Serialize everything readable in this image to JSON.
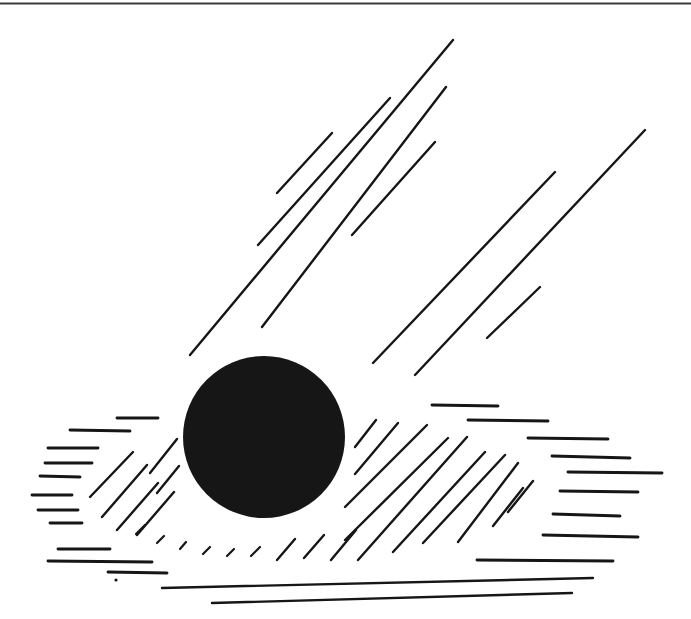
{
  "figure": {
    "background": "#ffffff",
    "ink": "#161616",
    "rule_color": "#3a3a3a",
    "canvas": {
      "width": 691,
      "height": 619
    },
    "top_rule": {
      "x1": 0,
      "y1": 3.5,
      "x2": 691,
      "y2": 3.5
    },
    "circle": {
      "cx": 264,
      "cy": 437,
      "r": 81
    },
    "rays": [
      [
        277,
        193,
        332,
        133
      ],
      [
        258,
        245,
        390,
        98
      ],
      [
        262,
        327,
        446,
        87
      ],
      [
        190,
        355,
        453,
        40
      ],
      [
        352,
        235,
        435,
        142
      ],
      [
        373,
        363,
        555,
        172
      ],
      [
        415,
        375,
        645,
        130
      ],
      [
        487,
        338,
        540,
        287
      ]
    ],
    "left_hatch": [
      [
        90,
        497,
        133,
        452
      ],
      [
        102,
        517,
        147,
        465
      ],
      [
        117,
        530,
        158,
        483
      ],
      [
        137,
        535,
        174,
        492
      ],
      [
        150,
        473,
        177,
        439
      ],
      [
        157,
        493,
        179,
        466
      ]
    ],
    "right_hatch": [
      [
        355,
        447,
        376,
        420
      ],
      [
        355,
        474,
        398,
        423
      ],
      [
        345,
        507,
        427,
        425
      ],
      [
        345,
        540,
        448,
        438
      ],
      [
        358,
        560,
        467,
        437
      ],
      [
        393,
        552,
        485,
        452
      ],
      [
        423,
        543,
        505,
        455
      ],
      [
        458,
        542,
        518,
        463
      ],
      [
        493,
        526,
        523,
        488
      ],
      [
        508,
        512,
        533,
        481
      ],
      [
        277,
        560,
        295,
        539
      ],
      [
        304,
        558,
        324,
        535
      ],
      [
        331,
        560,
        356,
        530
      ]
    ],
    "left_dashes": [
      [
        117,
        418,
        158,
        418
      ],
      [
        70,
        430,
        130,
        431
      ],
      [
        48,
        448,
        98,
        448
      ],
      [
        45,
        463,
        92,
        463
      ],
      [
        40,
        476,
        80,
        477
      ],
      [
        32,
        495,
        72,
        495
      ],
      [
        38,
        510,
        78,
        510
      ],
      [
        50,
        523,
        82,
        523
      ],
      [
        58,
        549,
        110,
        549
      ],
      [
        48,
        561,
        152,
        562
      ],
      [
        108,
        572,
        167,
        573
      ]
    ],
    "upper_dashes": [
      [
        432,
        405,
        498,
        406
      ],
      [
        468,
        420,
        548,
        421
      ]
    ],
    "right_dashes": [
      [
        528,
        438,
        608,
        439
      ],
      [
        552,
        456,
        630,
        458
      ],
      [
        568,
        472,
        662,
        473
      ],
      [
        560,
        491,
        638,
        492
      ],
      [
        553,
        514,
        620,
        516
      ],
      [
        543,
        535,
        638,
        537
      ]
    ],
    "bottom_dashes": [
      [
        477,
        560,
        613,
        561
      ]
    ],
    "bottom_lines": [
      [
        162,
        588,
        593,
        578
      ],
      [
        212,
        603,
        572,
        593
      ]
    ],
    "dotted_arc": [
      [
        136,
        534,
        145,
        525
      ],
      [
        157,
        543,
        164,
        536
      ],
      [
        180,
        549,
        186,
        542
      ],
      [
        203,
        554,
        210,
        547
      ],
      [
        227,
        556,
        234,
        549
      ],
      [
        251,
        556,
        260,
        547
      ]
    ],
    "dot": {
      "x": 116,
      "y": 580,
      "r": 1.6
    }
  }
}
